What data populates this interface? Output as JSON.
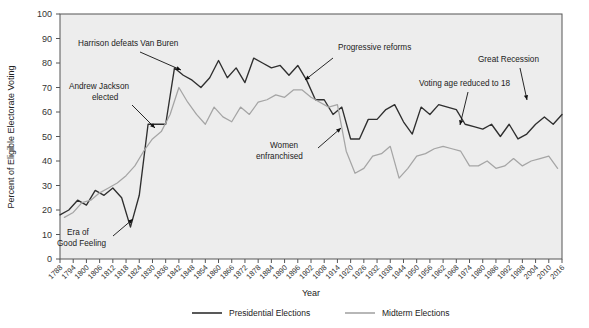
{
  "chart_data": {
    "type": "line",
    "title": "",
    "xlabel": "Year",
    "ylabel": "Percent of Eligible Electorate Voting",
    "ylim": [
      0,
      100
    ],
    "ytick_step": 10,
    "yticks": [
      0,
      10,
      20,
      30,
      40,
      50,
      60,
      70,
      80,
      90,
      100
    ],
    "xlim": [
      1788,
      2016
    ],
    "xticks": [
      1788,
      1794,
      1800,
      1806,
      1812,
      1818,
      1824,
      1830,
      1836,
      1842,
      1848,
      1854,
      1860,
      1866,
      1872,
      1878,
      1884,
      1890,
      1896,
      1902,
      1908,
      1914,
      1920,
      1926,
      1932,
      1938,
      1944,
      1950,
      1956,
      1962,
      1968,
      1974,
      1980,
      1986,
      1992,
      1998,
      2004,
      2010,
      2016
    ],
    "grid": "horizontal-bands",
    "legend_position": "bottom",
    "series": [
      {
        "name": "Presidential Elections",
        "color": "#2f2f2f",
        "x": [
          1788,
          1792,
          1796,
          1800,
          1804,
          1808,
          1812,
          1816,
          1820,
          1824,
          1828,
          1832,
          1836,
          1840,
          1844,
          1848,
          1852,
          1856,
          1860,
          1864,
          1868,
          1872,
          1876,
          1880,
          1884,
          1888,
          1892,
          1896,
          1900,
          1904,
          1908,
          1912,
          1916,
          1920,
          1924,
          1928,
          1932,
          1936,
          1940,
          1944,
          1948,
          1952,
          1956,
          1960,
          1964,
          1968,
          1972,
          1976,
          1980,
          1984,
          1988,
          1992,
          1996,
          2000,
          2004,
          2008,
          2012,
          2016
        ],
        "values": [
          18,
          20,
          24,
          22,
          28,
          26,
          29,
          25,
          13,
          26,
          55,
          55,
          55,
          78,
          75,
          73,
          70,
          74,
          81,
          74,
          78,
          72,
          82,
          80,
          78,
          79,
          75,
          79,
          73,
          65,
          65,
          59,
          62,
          49,
          49,
          57,
          57,
          61,
          63,
          56,
          51,
          62,
          59,
          63,
          62,
          61,
          55,
          54,
          53,
          55,
          50,
          55,
          49,
          51,
          55,
          58,
          55,
          59
        ]
      },
      {
        "name": "Midterm Elections",
        "color": "#a5a5a5",
        "x": [
          1790,
          1794,
          1798,
          1802,
          1806,
          1810,
          1814,
          1818,
          1822,
          1826,
          1830,
          1834,
          1838,
          1842,
          1846,
          1850,
          1854,
          1858,
          1862,
          1866,
          1870,
          1874,
          1878,
          1882,
          1886,
          1890,
          1894,
          1898,
          1902,
          1906,
          1910,
          1914,
          1918,
          1922,
          1926,
          1930,
          1934,
          1938,
          1942,
          1946,
          1950,
          1954,
          1958,
          1962,
          1966,
          1970,
          1974,
          1978,
          1982,
          1986,
          1990,
          1994,
          1998,
          2002,
          2006,
          2010,
          2014
        ],
        "values": [
          17,
          19,
          23,
          24,
          27,
          29,
          31,
          34,
          38,
          44,
          49,
          52,
          59,
          70,
          64,
          59,
          55,
          62,
          58,
          56,
          62,
          59,
          64,
          65,
          67,
          66,
          69,
          69,
          66,
          64,
          62,
          63,
          44,
          35,
          37,
          42,
          43,
          46,
          33,
          37,
          42,
          43,
          45,
          46,
          45,
          44,
          38,
          38,
          40,
          37,
          38,
          41,
          38,
          40,
          41,
          42,
          37
        ]
      }
    ],
    "annotations": [
      {
        "id": "harrison",
        "text": "Harrison defeats Van Buren"
      },
      {
        "id": "jackson1",
        "text": "Andrew Jackson"
      },
      {
        "id": "jackson2",
        "text": "elected"
      },
      {
        "id": "era1",
        "text": "Era of"
      },
      {
        "id": "era2",
        "text": "Good Feeling"
      },
      {
        "id": "progressive",
        "text": "Progressive reforms"
      },
      {
        "id": "women1",
        "text": "Women"
      },
      {
        "id": "women2",
        "text": "enfranchised"
      },
      {
        "id": "votingage",
        "text": "Voting age reduced to 18"
      },
      {
        "id": "recession",
        "text": "Great Recession"
      }
    ]
  },
  "legend": {
    "items": [
      {
        "label": "Presidential Elections",
        "color": "#2f2f2f"
      },
      {
        "label": "Midterm Elections",
        "color": "#a5a5a5"
      }
    ]
  },
  "axes": {
    "y_title": "Percent of Eligible Electorate Voting",
    "x_title": "Year"
  }
}
